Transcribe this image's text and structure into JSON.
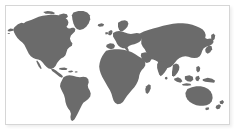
{
  "panel": {
    "kind": "world-map-figure",
    "border_color": "#d6d6d6",
    "background_color": "#ffffff"
  },
  "map": {
    "projection": "equirectangular",
    "land_color": "#6b6b6b",
    "ocean_color": "#ffffff",
    "has_labels": false,
    "has_graticule": false,
    "has_legend": false,
    "regions": [
      {
        "id": "north-america",
        "label": "North America"
      },
      {
        "id": "greenland",
        "label": "Greenland"
      },
      {
        "id": "canadian-arctic",
        "label": "Canadian Arctic Islands"
      },
      {
        "id": "central-america",
        "label": "Central America"
      },
      {
        "id": "caribbean",
        "label": "Caribbean Islands"
      },
      {
        "id": "south-america",
        "label": "South America"
      },
      {
        "id": "europe",
        "label": "Europe"
      },
      {
        "id": "british-isles",
        "label": "British Isles"
      },
      {
        "id": "scandinavia",
        "label": "Scandinavia"
      },
      {
        "id": "africa",
        "label": "Africa"
      },
      {
        "id": "madagascar",
        "label": "Madagascar"
      },
      {
        "id": "asia",
        "label": "Asia"
      },
      {
        "id": "russia",
        "label": "Russia"
      },
      {
        "id": "india",
        "label": "India"
      },
      {
        "id": "southeast-asia",
        "label": "Southeast Asia"
      },
      {
        "id": "indonesia",
        "label": "Indonesia"
      },
      {
        "id": "japan",
        "label": "Japan"
      },
      {
        "id": "philippines",
        "label": "Philippines"
      },
      {
        "id": "australia",
        "label": "Australia"
      },
      {
        "id": "new-zealand",
        "label": "New Zealand"
      },
      {
        "id": "iceland",
        "label": "Iceland"
      },
      {
        "id": "new-guinea",
        "label": "New Guinea"
      },
      {
        "id": "sri-lanka",
        "label": "Sri Lanka"
      }
    ]
  }
}
